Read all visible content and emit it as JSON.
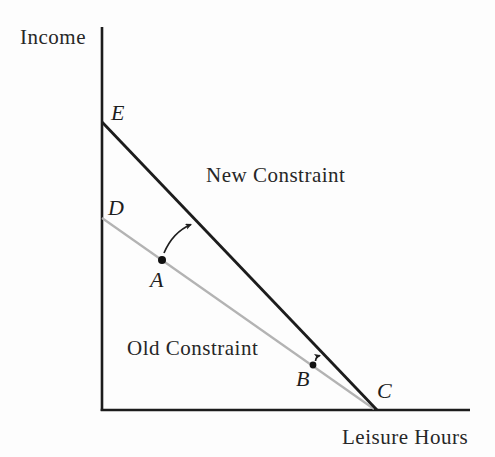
{
  "figure": {
    "y_axis_label": "Income",
    "x_axis_label": "Leisure Hours",
    "new_constraint_label": "New Constraint",
    "old_constraint_label": "Old Constraint",
    "points": {
      "E": "E",
      "D": "D",
      "A": "A",
      "B": "B",
      "C": "C"
    },
    "colors": {
      "axis": "#1c1c1c",
      "new_constraint": "#1c1c1c",
      "old_constraint": "#b3b3b3",
      "dot": "#111111",
      "arrow": "#1e1e1e"
    }
  }
}
